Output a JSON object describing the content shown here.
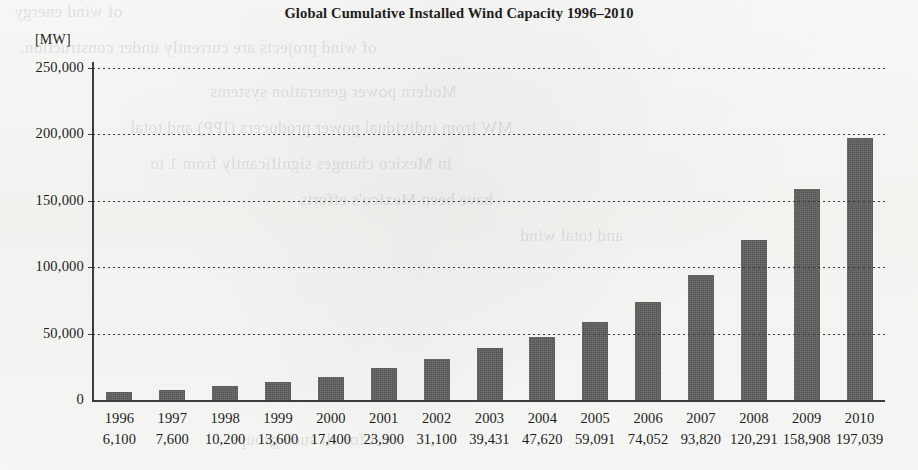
{
  "chart_data": {
    "type": "bar",
    "title": "Global Cumulative Installed Wind Capacity 1996–2010",
    "xlabel": "",
    "ylabel": "[MW]",
    "unit_label": "[MW]",
    "categories": [
      "1996",
      "1997",
      "1998",
      "1999",
      "2000",
      "2001",
      "2002",
      "2003",
      "2004",
      "2005",
      "2006",
      "2007",
      "2008",
      "2009",
      "2010"
    ],
    "values": [
      6100,
      7600,
      10200,
      13600,
      17400,
      23900,
      31100,
      39431,
      47620,
      59091,
      74052,
      93820,
      120291,
      158908,
      197039
    ],
    "value_labels": [
      "6,100",
      "7,600",
      "10,200",
      "13,600",
      "17,400",
      "23,900",
      "31,100",
      "39,431",
      "47,620",
      "59,091",
      "74,052",
      "93,820",
      "120,291",
      "158,908",
      "197,039"
    ],
    "ylim": [
      0,
      250000
    ],
    "yticks": [
      0,
      50000,
      100000,
      150000,
      200000,
      250000
    ],
    "ytick_labels": [
      "0",
      "50,000",
      "100,000",
      "150,000",
      "200,000",
      "250,000"
    ],
    "grid": true,
    "grid_style": "dotted",
    "legend": "none",
    "bar_color": "#5e5e5e",
    "axis_color": "#3b3b3b",
    "background_color": "#f8f8f6"
  },
  "bleed_through": [
    {
      "text": "of wind energy",
      "x": 14,
      "y": 2,
      "size": 17
    },
    {
      "text": "of wind projects are currently under construction.",
      "x": 20,
      "y": 38,
      "size": 17
    },
    {
      "text": "Modern power generation systems",
      "x": 210,
      "y": 82,
      "size": 17
    },
    {
      "text": "MW from individual power producers (IPP) and total",
      "x": 130,
      "y": 118,
      "size": 17
    },
    {
      "text": "in Mexico changes significantly from 1 to",
      "x": 150,
      "y": 154,
      "size": 17
    },
    {
      "text": "have been Mexico's efforts",
      "x": 300,
      "y": 190,
      "size": 17
    },
    {
      "text": "and total wind",
      "x": 520,
      "y": 226,
      "size": 17
    },
    {
      "text": "cost for all such groups",
      "x": 230,
      "y": 430,
      "size": 17
    }
  ]
}
